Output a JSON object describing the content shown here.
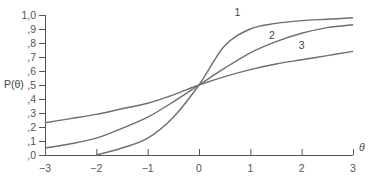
{
  "chart_data": {
    "type": "line",
    "title": "",
    "xlabel": "θ",
    "ylabel": "P(θ)",
    "xlim": [
      -3,
      3
    ],
    "ylim": [
      0,
      1.0
    ],
    "grid": false,
    "legend": "inline curve labels",
    "x_ticks": [
      "−3",
      "−2",
      "−1",
      "0",
      "1",
      "2",
      "3"
    ],
    "y_ticks": [
      ",0",
      ",1",
      ",2",
      ",3",
      ",4",
      ",5",
      ",6",
      ",7",
      ",8",
      ",9",
      "1,0"
    ],
    "x": [
      -3,
      -2.5,
      -2,
      -1.5,
      -1,
      -0.5,
      0,
      0.5,
      1,
      1.5,
      2,
      2.5,
      3
    ],
    "series": [
      {
        "name": "1",
        "values": [
          null,
          null,
          0.0,
          0.05,
          0.12,
          0.27,
          0.5,
          0.78,
          0.9,
          0.94,
          0.96,
          0.97,
          0.98
        ]
      },
      {
        "name": "2",
        "values": [
          0.05,
          0.08,
          0.12,
          0.19,
          0.27,
          0.38,
          0.5,
          0.62,
          0.73,
          0.81,
          0.87,
          0.91,
          0.93
        ]
      },
      {
        "name": "3",
        "values": [
          0.23,
          0.26,
          0.29,
          0.33,
          0.37,
          0.43,
          0.5,
          0.56,
          0.61,
          0.65,
          0.68,
          0.71,
          0.74
        ]
      }
    ],
    "colors": {
      "axis": "#555555",
      "curve": "#6e6e6e"
    }
  }
}
